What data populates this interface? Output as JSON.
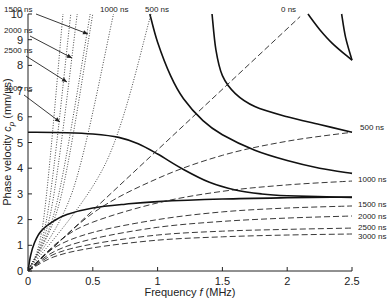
{
  "chart_data": {
    "type": "line",
    "title": "",
    "xlabel": "Frequency f (MHz)",
    "ylabel": "Phase velocity c_p (mm/µs)",
    "xlim": [
      0,
      2.5
    ],
    "ylim": [
      0,
      10
    ],
    "xticks": [
      "0",
      "0.5",
      "1",
      "1.5",
      "2",
      "2.5"
    ],
    "xtick_values": [
      0,
      0.5,
      1,
      1.5,
      2,
      2.5
    ],
    "yticks": [
      "0",
      "1",
      "2",
      "3",
      "4",
      "5",
      "6",
      "7",
      "8",
      "9",
      "10"
    ],
    "ytick_values": [
      0,
      1,
      2,
      3,
      4,
      5,
      6,
      7,
      8,
      9,
      10
    ],
    "grid": false,
    "legend": "none (inline annotations)",
    "series": [
      {
        "name": "Dispersion mode A0",
        "style": "solid",
        "points": [
          [
            0,
            0
          ],
          [
            0.02,
            0.6
          ],
          [
            0.05,
            1.1
          ],
          [
            0.1,
            1.55
          ],
          [
            0.2,
            1.95
          ],
          [
            0.3,
            2.2
          ],
          [
            0.5,
            2.45
          ],
          [
            0.75,
            2.6
          ],
          [
            1.0,
            2.7
          ],
          [
            1.5,
            2.8
          ],
          [
            2.0,
            2.85
          ],
          [
            2.5,
            2.88
          ]
        ]
      },
      {
        "name": "Dispersion mode S0",
        "style": "solid",
        "points": [
          [
            0,
            5.4
          ],
          [
            0.3,
            5.38
          ],
          [
            0.5,
            5.33
          ],
          [
            0.7,
            5.2
          ],
          [
            0.85,
            4.95
          ],
          [
            1.0,
            4.55
          ],
          [
            1.2,
            3.95
          ],
          [
            1.4,
            3.45
          ],
          [
            1.6,
            3.15
          ],
          [
            1.8,
            3.0
          ],
          [
            2.0,
            2.93
          ],
          [
            2.5,
            2.86
          ]
        ]
      },
      {
        "name": "Dispersion mode A1",
        "style": "solid",
        "points": [
          [
            0.94,
            10
          ],
          [
            1.0,
            8.9
          ],
          [
            1.1,
            7.6
          ],
          [
            1.2,
            6.7
          ],
          [
            1.35,
            5.85
          ],
          [
            1.5,
            5.3
          ],
          [
            1.75,
            4.7
          ],
          [
            2.0,
            4.3
          ],
          [
            2.25,
            4.0
          ],
          [
            2.5,
            3.8
          ]
        ]
      },
      {
        "name": "Dispersion mode S1",
        "style": "solid",
        "points": [
          [
            1.42,
            10
          ],
          [
            1.45,
            8.6
          ],
          [
            1.5,
            7.6
          ],
          [
            1.6,
            6.9
          ],
          [
            1.75,
            6.4
          ],
          [
            2.0,
            6.0
          ],
          [
            2.25,
            5.7
          ],
          [
            2.5,
            5.4
          ]
        ]
      },
      {
        "name": "Dispersion mode upper-1",
        "style": "solid",
        "points": [
          [
            2.16,
            10
          ],
          [
            2.25,
            9.4
          ],
          [
            2.35,
            8.85
          ],
          [
            2.5,
            8.2
          ]
        ]
      },
      {
        "name": "Dispersion mode upper-2",
        "style": "solid",
        "points": [
          [
            2.42,
            10
          ],
          [
            2.45,
            9.1
          ],
          [
            2.5,
            8.2
          ]
        ]
      },
      {
        "name": "0 ns",
        "style": "dashed",
        "points": [
          [
            0,
            0
          ],
          [
            2.1,
            9.9
          ]
        ]
      },
      {
        "name": "500 ns",
        "style": "dashed",
        "points": [
          [
            0,
            0
          ],
          [
            0.5,
            2.25
          ],
          [
            1.0,
            3.6
          ],
          [
            1.5,
            4.5
          ],
          [
            2.0,
            5.05
          ],
          [
            2.5,
            5.4
          ]
        ]
      },
      {
        "name": "1000 ns",
        "style": "dashed",
        "points": [
          [
            0,
            0
          ],
          [
            0.25,
            1.2
          ],
          [
            0.5,
            1.9
          ],
          [
            1.0,
            2.65
          ],
          [
            1.5,
            3.1
          ],
          [
            2.0,
            3.35
          ],
          [
            2.5,
            3.5
          ]
        ]
      },
      {
        "name": "1500 ns",
        "style": "dashed",
        "points": [
          [
            0,
            0
          ],
          [
            0.2,
            0.9
          ],
          [
            0.5,
            1.5
          ],
          [
            1.0,
            2.0
          ],
          [
            1.5,
            2.3
          ],
          [
            2.0,
            2.45
          ],
          [
            2.5,
            2.53
          ]
        ]
      },
      {
        "name": "2000 ns",
        "style": "dashed",
        "points": [
          [
            0,
            0
          ],
          [
            0.2,
            0.75
          ],
          [
            0.5,
            1.25
          ],
          [
            1.0,
            1.7
          ],
          [
            1.5,
            1.93
          ],
          [
            2.0,
            2.06
          ],
          [
            2.5,
            2.14
          ]
        ]
      },
      {
        "name": "2500 ns",
        "style": "dashed",
        "points": [
          [
            0,
            0
          ],
          [
            0.2,
            0.65
          ],
          [
            0.5,
            1.05
          ],
          [
            1.0,
            1.4
          ],
          [
            1.5,
            1.55
          ],
          [
            2.0,
            1.62
          ],
          [
            2.5,
            1.67
          ]
        ]
      },
      {
        "name": "3000 ns",
        "style": "dashed",
        "points": [
          [
            0,
            0
          ],
          [
            0.2,
            0.55
          ],
          [
            0.5,
            0.9
          ],
          [
            1.0,
            1.2
          ],
          [
            1.5,
            1.33
          ],
          [
            2.0,
            1.4
          ],
          [
            2.5,
            1.44
          ]
        ]
      },
      {
        "name": "500 ns (dotted)",
        "style": "dotted",
        "points": [
          [
            0,
            0
          ],
          [
            0.6,
            4.2
          ],
          [
            0.95,
            10
          ]
        ]
      },
      {
        "name": "1000 ns (dotted)",
        "style": "dotted",
        "points": [
          [
            0,
            0
          ],
          [
            0.35,
            3.2
          ],
          [
            0.66,
            10
          ]
        ]
      },
      {
        "name": "1500 ns (dotted)",
        "style": "dotted",
        "points": [
          [
            0,
            0
          ],
          [
            0.25,
            2.8
          ],
          [
            0.5,
            10
          ]
        ]
      },
      {
        "name": "1750 ns (dotted)",
        "style": "dotted",
        "points": [
          [
            0,
            0
          ],
          [
            0.22,
            2.6
          ],
          [
            0.48,
            10
          ]
        ]
      },
      {
        "name": "2000 ns (dotted)",
        "style": "dotted",
        "points": [
          [
            0,
            0
          ],
          [
            0.18,
            2.4
          ],
          [
            0.38,
            10
          ]
        ]
      },
      {
        "name": "2500 ns (dotted)",
        "style": "dotted",
        "points": [
          [
            0,
            0
          ],
          [
            0.15,
            2.2
          ],
          [
            0.33,
            10
          ]
        ]
      },
      {
        "name": "3000 ns (dotted)",
        "style": "dotted",
        "points": [
          [
            0,
            0
          ],
          [
            0.12,
            2.0
          ],
          [
            0.27,
            10
          ]
        ]
      }
    ],
    "annotations": [
      {
        "text": "1500 ns",
        "x": 4,
        "y": 12
      },
      {
        "text": "2000 ns",
        "x": 4,
        "y": 33
      },
      {
        "text": "2500 ns",
        "x": 4,
        "y": 53
      },
      {
        "text": "3000 ns",
        "x": 4,
        "y": 91
      },
      {
        "text": "1000 ns",
        "x": 100,
        "y": 12
      },
      {
        "text": "500 ns",
        "x": 145,
        "y": 12
      },
      {
        "text": "0 ns",
        "x": 281,
        "y": 12
      },
      {
        "text": "500 ns",
        "x": 360,
        "y": 130
      },
      {
        "text": "1000 ns",
        "x": 358,
        "y": 182
      },
      {
        "text": "1500 ns",
        "x": 358,
        "y": 207
      },
      {
        "text": "2000 ns",
        "x": 358,
        "y": 219
      },
      {
        "text": "2500 ns",
        "x": 358,
        "y": 230
      },
      {
        "text": "3000 ns",
        "x": 358,
        "y": 239
      }
    ]
  },
  "labels": {
    "xlabel_main": "Frequency ",
    "xlabel_var": "f",
    "xlabel_unit": " (MHz)",
    "ylabel_main": "Phase velocity ",
    "ylabel_var": "c",
    "ylabel_sub": "p",
    "ylabel_unit": " (mm/µs)"
  }
}
